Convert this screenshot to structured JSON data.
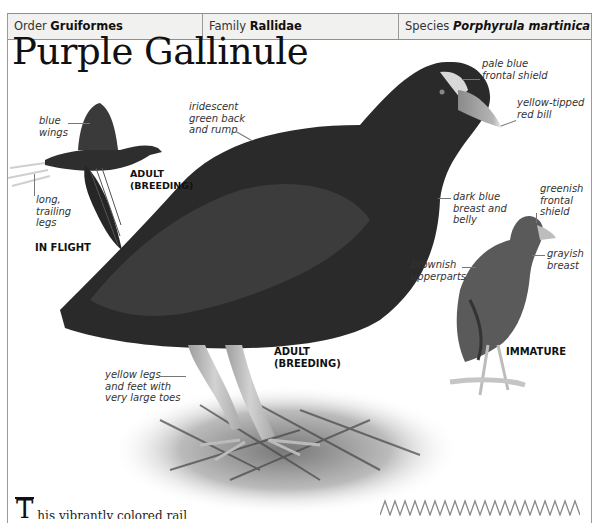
{
  "header": {
    "order_label": "Order",
    "order_value": "Gruiformes",
    "family_label": "Family",
    "family_value": "Rallidae",
    "species_label": "Species",
    "species_value": "Porphyrula martinica"
  },
  "title": "Purple Gallinule",
  "flight_figure": {
    "labels": {
      "wings": "blue\nwings",
      "legs": "long,\ntrailing\nlegs"
    },
    "caption_age": "ADULT\n(BREEDING)",
    "caption_pose": "IN FLIGHT"
  },
  "adult_figure": {
    "labels": {
      "back": "iridescent\ngreen back\nand rump",
      "shield": "pale blue\nfrontal shield",
      "bill": "yellow-tipped\nred bill",
      "breast": "dark blue\nbreast and\nbelly",
      "legs": "yellow legs\nand feet with\nvery large toes"
    },
    "caption": "ADULT\n(BREEDING)"
  },
  "immature_figure": {
    "labels": {
      "shield": "greenish\nfrontal\nshield",
      "breast": "grayish\nbreast",
      "upperparts": "brownish\nupperparts"
    },
    "caption": "IMMATURE"
  },
  "body": {
    "dropcap": "T",
    "text": "his vibrantly colored rail"
  },
  "colors": {
    "frame": "#9a9a9a",
    "header_bg": "#f1f1ef",
    "text": "#333333"
  }
}
